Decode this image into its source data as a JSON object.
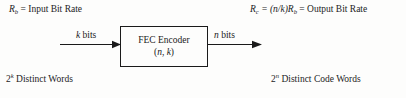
{
  "diagram": {
    "title_visible": false,
    "background_color": "#fdfdfc",
    "stroke_color": "#1a1a1a",
    "input_rate_label": {
      "symbol": "R",
      "subscript": "b",
      "equals": " = Input Bit Rate"
    },
    "output_rate_label": {
      "symbol": "R",
      "subscript": "c",
      "equals": " = (n/k)",
      "symbol2": "R",
      "subscript2": "b",
      "equals2": " = Output Bit Rate"
    },
    "input_words_label": {
      "base": "2",
      "exponent": "k",
      "text": " Distinct Words"
    },
    "output_words_label": {
      "base": "2",
      "exponent": "n",
      "text": " Distinct Code Words"
    },
    "input_arrow_label": {
      "symbol": "k",
      "text": " bits"
    },
    "output_arrow_label": {
      "symbol": "n",
      "text": " bits"
    },
    "encoder_block": {
      "line1": "FEC Encoder",
      "line2_open": "(",
      "line2_n": "n",
      "line2_comma": ", ",
      "line2_k": "k",
      "line2_close": ")"
    }
  }
}
